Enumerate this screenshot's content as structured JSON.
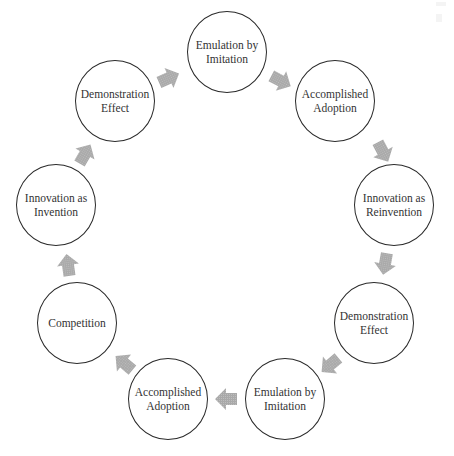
{
  "diagram": {
    "type": "cycle",
    "node_radius": 40,
    "arrow_color": "#a9a9a9",
    "arrow_hatch_color": "#bdbdbd",
    "circle_stroke": "#2a2a2a",
    "nodes": [
      {
        "id": "n1",
        "label": "Emulation by\nImitation",
        "cx": 227,
        "cy": 52
      },
      {
        "id": "n2",
        "label": "Accomplished\nAdoption",
        "cx": 335,
        "cy": 101
      },
      {
        "id": "n3",
        "label": "Innovation as\nReinvention",
        "cx": 394,
        "cy": 205
      },
      {
        "id": "n4",
        "label": "Demonstration\nEffect",
        "cx": 374,
        "cy": 323
      },
      {
        "id": "n5",
        "label": "Emulation by\nImitation",
        "cx": 285,
        "cy": 399
      },
      {
        "id": "n6",
        "label": "Accomplished\nAdoption",
        "cx": 168,
        "cy": 399
      },
      {
        "id": "n7",
        "label": "Competition",
        "cx": 77,
        "cy": 323
      },
      {
        "id": "n8",
        "label": "Innovation as\nInvention",
        "cx": 56,
        "cy": 205
      },
      {
        "id": "n9",
        "label": "Demonstration\nEffect",
        "cx": 115,
        "cy": 101
      }
    ],
    "arrows": [
      {
        "from": "n9",
        "to": "n1",
        "x": 169,
        "y": 78,
        "angle": -24
      },
      {
        "from": "n1",
        "to": "n2",
        "x": 281,
        "y": 81,
        "angle": 28
      },
      {
        "from": "n2",
        "to": "n3",
        "x": 383,
        "y": 152,
        "angle": 62
      },
      {
        "from": "n3",
        "to": "n4",
        "x": 385,
        "y": 264,
        "angle": 100
      },
      {
        "from": "n4",
        "to": "n5",
        "x": 330,
        "y": 365,
        "angle": 140
      },
      {
        "from": "n5",
        "to": "n6",
        "x": 226,
        "y": 399,
        "angle": 180
      },
      {
        "from": "n6",
        "to": "n7",
        "x": 124,
        "y": 363,
        "angle": 220
      },
      {
        "from": "n7",
        "to": "n8",
        "x": 68,
        "y": 265,
        "angle": 262
      },
      {
        "from": "n8",
        "to": "n9",
        "x": 85,
        "y": 154,
        "angle": 300
      }
    ]
  }
}
